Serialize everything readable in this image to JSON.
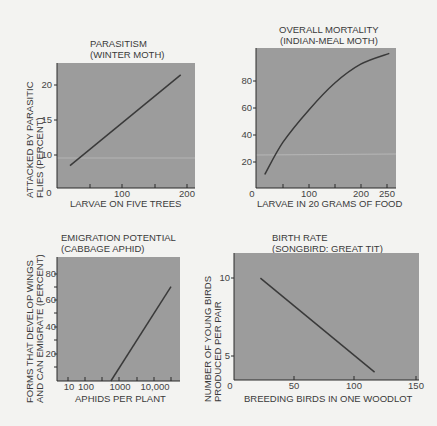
{
  "colors": {
    "background": "#f3f3f1",
    "plot_fill": "#9c9c9c",
    "axis": "#2a2a2a",
    "line": "#3a3a3a",
    "text": "#3a3a3a"
  },
  "chart_data": [
    {
      "type": "line",
      "title": "PARASITISM",
      "subtitle": "(WINTER MOTH)",
      "xlabel": "LARVAE ON FIVE TREES",
      "ylabel_line1": "ATTACKED BY PARASITIC",
      "ylabel_line2": "FLIES (PERCENT)",
      "origin_label": "0",
      "xticks": [
        "100",
        "200"
      ],
      "yticks": [
        "10",
        "15",
        "20"
      ],
      "xlim": [
        0,
        210
      ],
      "ylim": [
        5,
        23
      ],
      "x": [
        20,
        190
      ],
      "y": [
        8.5,
        21.5
      ],
      "grid": false
    },
    {
      "type": "line",
      "title": "OVERALL MORTALITY",
      "subtitle": "(INDIAN-MEAL MOTH)",
      "xlabel": "LARVAE IN 20 GRAMS OF FOOD",
      "ylabel_line1": "",
      "ylabel_line2": "",
      "origin_label": "0",
      "xticks": [
        "100",
        "200",
        "250"
      ],
      "yticks": [
        "20",
        "40",
        "60",
        "80"
      ],
      "xlim": [
        0,
        265
      ],
      "ylim": [
        0,
        104
      ],
      "x": [
        15,
        50,
        100,
        150,
        200,
        255
      ],
      "y": [
        10,
        34,
        58,
        78,
        92,
        100
      ],
      "grid": false
    },
    {
      "type": "line",
      "title": "EMIGRATION POTENTIAL",
      "subtitle": "(CABBAGE APHID)",
      "xlabel": "APHIDS PER PLANT",
      "ylabel_line1": "FORMS THAT DEVELOP WINGS",
      "ylabel_line2": "AND CAN EMIGRATE (PERCENT)",
      "x_scale": "log",
      "xticks": [
        "10",
        "100",
        "1000",
        "10,000"
      ],
      "yticks": [
        "20",
        "40",
        "60",
        "80"
      ],
      "xlim": [
        5,
        40000
      ],
      "ylim": [
        0,
        92
      ],
      "x": [
        200,
        20000
      ],
      "y": [
        0,
        70
      ],
      "grid": false
    },
    {
      "type": "line",
      "title": "BIRTH RATE",
      "subtitle": "(SONGBIRD: GREAT TIT)",
      "xlabel": "BREEDING BIRDS IN ONE WOODLOT",
      "ylabel_line1": "NUMBER OF YOUNG BIRDS",
      "ylabel_line2": "PRODUCED PER PAIR",
      "origin_label": "0",
      "xticks": [
        "50",
        "100",
        "150"
      ],
      "yticks": [
        "5",
        "10"
      ],
      "xlim": [
        0,
        155
      ],
      "ylim": [
        3.5,
        11.5
      ],
      "x": [
        22,
        117
      ],
      "y": [
        10,
        4
      ],
      "grid": false
    }
  ]
}
